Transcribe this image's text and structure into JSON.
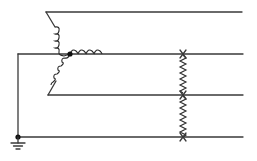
{
  "diagram": {
    "type": "three-phase wye-connected source with grounded neutral and line-to-line impedances",
    "colors": {
      "line": "#3a3a3a",
      "node": "#111111",
      "background": "#ffffff"
    },
    "nodes": [
      {
        "id": "neutral",
        "label": "",
        "x": 70,
        "y": 54
      },
      {
        "id": "ground-node",
        "label": "",
        "x": 18,
        "y": 137
      }
    ],
    "conductors": [
      {
        "id": "line-1",
        "y": 12,
        "x_start": 46,
        "x_end": 242
      },
      {
        "id": "line-2",
        "y": 54,
        "x_start": 18,
        "x_end": 243
      },
      {
        "id": "line-3",
        "y": 95,
        "x_start": 48,
        "x_end": 243
      },
      {
        "id": "line-4-ground",
        "y": 137,
        "x_start": 18,
        "x_end": 243
      }
    ],
    "windings": [
      {
        "id": "winding-a",
        "from": "neutral",
        "to": "line-1"
      },
      {
        "id": "winding-b",
        "from": "neutral",
        "to": "line-2"
      },
      {
        "id": "winding-c",
        "from": "neutral",
        "to": "line-3"
      }
    ],
    "impedances": [
      {
        "id": "impedance-2-3",
        "x": 183,
        "from_y": 54,
        "to_y": 95
      },
      {
        "id": "impedance-3-4",
        "x": 183,
        "from_y": 95,
        "to_y": 137
      }
    ],
    "ground_symbol": {
      "x": 18,
      "y": 143
    }
  }
}
